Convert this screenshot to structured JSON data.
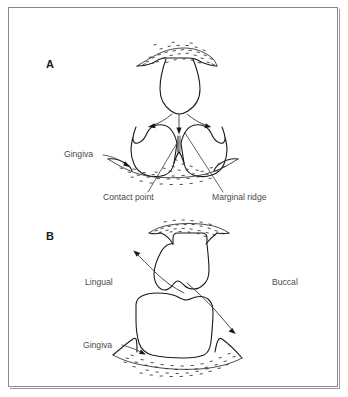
{
  "figure": {
    "background_color": "#ffffff",
    "frame_color": "#8a8a8a",
    "line_color": "#1a1a1a",
    "label_color": "#4a4a4a"
  },
  "panels": [
    {
      "id": "A",
      "label": "A",
      "description": "Facial view of two adjacent posterior teeth with an opposing cusp seating into the embrasure",
      "annotations": [
        {
          "name": "gingiva",
          "text": "Gingiva"
        },
        {
          "name": "contact-point",
          "text": "Contact point"
        },
        {
          "name": "marginal-ridge",
          "text": "Marginal ridge"
        }
      ]
    },
    {
      "id": "B",
      "label": "B",
      "description": "Cross-section showing food flow through the embrasure between lingual and buccal surfaces",
      "annotations": [
        {
          "name": "lingual",
          "text": "Lingual"
        },
        {
          "name": "buccal",
          "text": "Buccal"
        },
        {
          "name": "gingiva",
          "text": "Gingiva"
        }
      ]
    }
  ]
}
